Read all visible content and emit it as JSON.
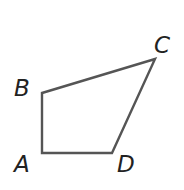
{
  "diagram": {
    "type": "quadrilateral",
    "stroke_color": "#555555",
    "label_color": "#222222",
    "vertices": [
      {
        "name": "A",
        "x": 42,
        "y": 153,
        "label": "A",
        "label_x": 14,
        "label_y": 153
      },
      {
        "name": "B",
        "x": 42,
        "y": 93,
        "label": "B",
        "label_x": 14,
        "label_y": 76
      },
      {
        "name": "C",
        "x": 155,
        "y": 59,
        "label": "C",
        "label_x": 154,
        "label_y": 36
      },
      {
        "name": "D",
        "x": 112,
        "y": 153,
        "label": "D",
        "label_x": 117,
        "label_y": 153
      }
    ],
    "edges": [
      "AB",
      "BC",
      "CD",
      "DA"
    ]
  }
}
